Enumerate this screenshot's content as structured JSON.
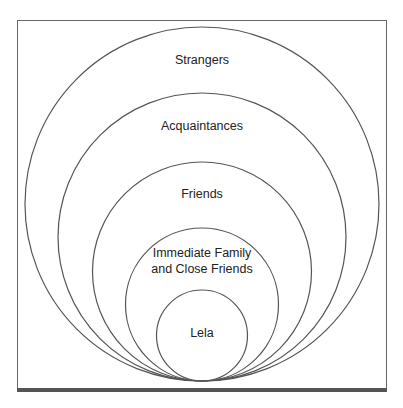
{
  "diagram": {
    "type": "nested-circles",
    "layers": [
      {
        "label": "Strangers"
      },
      {
        "label": "Acquaintances"
      },
      {
        "label": "Friends"
      },
      {
        "label": "Immediate Family",
        "label2": "and Close Friends"
      },
      {
        "label": "Lela"
      }
    ],
    "colors": {
      "stroke": "#555555",
      "frame": "#666666",
      "base": "#555555"
    }
  }
}
